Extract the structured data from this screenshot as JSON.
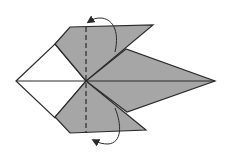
{
  "diagram": {
    "colors": {
      "paper_colored": "#a6a6a6",
      "paper_white": "#ffffff",
      "line": "#2a2a2a"
    },
    "annotations": [
      {
        "type": "valley-fold-line",
        "label": "dashed fold line"
      },
      {
        "type": "fold-arrow",
        "direction": "behind",
        "position": "top"
      },
      {
        "type": "fold-arrow",
        "direction": "behind",
        "position": "bottom"
      }
    ]
  }
}
